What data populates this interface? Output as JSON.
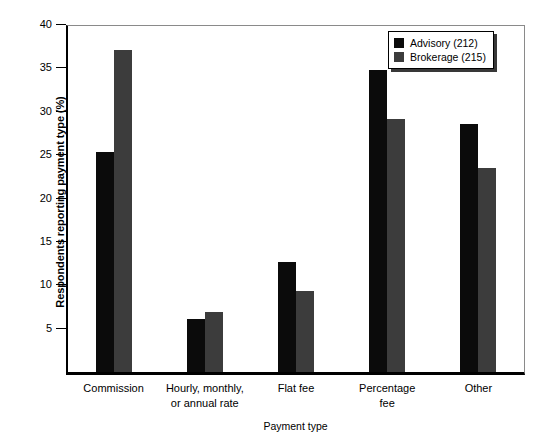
{
  "chart_data": {
    "type": "bar",
    "title": "",
    "xlabel": "Payment type",
    "ylabel": "Respondents reporting payment type (%)",
    "categories": [
      "Commission",
      "Hourly, monthly,\nor annual rate",
      "Flat fee",
      "Percentage\nfee",
      "Other"
    ],
    "series": [
      {
        "name": "Advisory (212)",
        "color": "#0b0b0b",
        "values": [
          25.4,
          6.1,
          12.7,
          34.8,
          28.6
        ]
      },
      {
        "name": "Brokerage (215)",
        "color": "#3c3c3c",
        "values": [
          37.1,
          6.9,
          9.3,
          29.2,
          23.5
        ]
      }
    ],
    "ylim": [
      0,
      40
    ],
    "yticks": [
      5,
      10,
      15,
      20,
      25,
      30,
      35,
      40
    ],
    "ytick_labels": [
      "5",
      "10",
      "15",
      "20",
      "25",
      "30",
      "35",
      "40"
    ],
    "grid": false,
    "legend_position": "top-right"
  },
  "legend": {
    "entries": [
      {
        "label": "Advisory (212)",
        "color": "#0b0b0b"
      },
      {
        "label": "Brokerage (215)",
        "color": "#3c3c3c"
      }
    ]
  }
}
